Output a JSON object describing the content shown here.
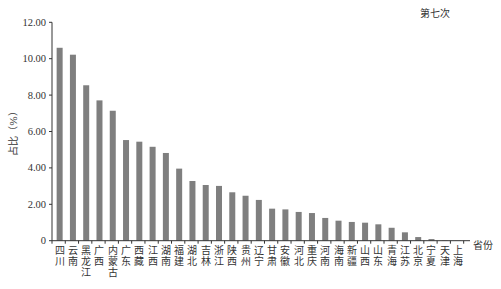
{
  "chart_data": {
    "type": "bar",
    "title": "第七次",
    "xlabel": "省份",
    "ylabel": "占比（%）",
    "ylim": [
      0,
      12
    ],
    "yticks": [
      "0",
      "2.00",
      "4.00",
      "6.00",
      "8.00",
      "10.00",
      "12.00"
    ],
    "ytick_values": [
      0,
      2,
      4,
      6,
      8,
      10,
      12
    ],
    "grid": false,
    "legend": null,
    "bar_color": "#7f7f7f",
    "categories": [
      "四川",
      "云南",
      "黑龙江",
      "广西",
      "内蒙古",
      "广东",
      "西藏",
      "江西",
      "湖南",
      "福建",
      "湖北",
      "吉林",
      "浙江",
      "陕西",
      "贵州",
      "辽宁",
      "甘肃",
      "安徽",
      "河北",
      "重庆",
      "河南",
      "海南",
      "新疆",
      "山西",
      "山东",
      "青海",
      "江苏",
      "北京",
      "宁夏",
      "天津",
      "上海"
    ],
    "values": [
      10.6,
      10.22,
      8.54,
      7.71,
      7.14,
      5.53,
      5.44,
      5.16,
      4.82,
      3.96,
      3.28,
      3.06,
      3.01,
      2.66,
      2.47,
      2.24,
      1.76,
      1.72,
      1.58,
      1.52,
      1.25,
      1.1,
      1.03,
      0.99,
      0.9,
      0.71,
      0.46,
      0.2,
      0.09,
      0.02,
      0.01
    ]
  }
}
